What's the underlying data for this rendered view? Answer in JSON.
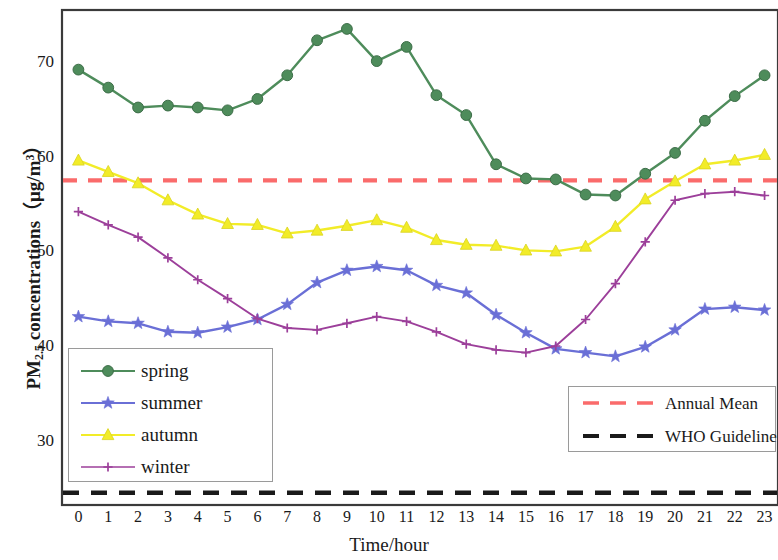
{
  "chart_data": {
    "type": "line",
    "title": "",
    "xlabel": "Time/hour",
    "ylabel": "PM2.5 concentrations （μg/m³）",
    "ylabel_parts": {
      "main": "PM",
      "subscript": "2.5",
      "rest": " concentrations",
      "unit_open": "（",
      "unit": "μg/m",
      "unit_sup": "3",
      "unit_close": "）"
    },
    "x": [
      0,
      1,
      2,
      3,
      4,
      5,
      6,
      7,
      8,
      9,
      10,
      11,
      12,
      13,
      14,
      15,
      16,
      17,
      18,
      19,
      20,
      21,
      22,
      23
    ],
    "xtick_labels": [
      "0",
      "1",
      "2",
      "3",
      "4",
      "5",
      "6",
      "7",
      "8",
      "9",
      "10",
      "11",
      "12",
      "13",
      "14",
      "15",
      "16",
      "17",
      "18",
      "19",
      "20",
      "21",
      "22",
      "23"
    ],
    "ytick_labels": [
      "70",
      "60",
      "50",
      "40",
      "30"
    ],
    "ytick_values": [
      70,
      60,
      50,
      40,
      30
    ],
    "xlim": [
      -0.55,
      23.45
    ],
    "ylim": [
      23.2,
      75.5
    ],
    "grid": false,
    "legend_position": "inside-lower-left and inside-lower-right",
    "series": [
      {
        "name": "spring",
        "color": "#4e8c5b",
        "marker": "circle",
        "values": [
          69.2,
          67.3,
          65.2,
          65.4,
          65.2,
          64.9,
          66.1,
          68.6,
          72.3,
          73.5,
          70.1,
          71.6,
          66.5,
          64.4,
          59.2,
          57.7,
          57.6,
          56.0,
          55.9,
          58.2,
          60.4,
          63.8,
          66.4,
          68.6
        ]
      },
      {
        "name": "summer",
        "color": "#6a6fd6",
        "marker": "star",
        "values": [
          43.1,
          42.6,
          42.4,
          41.5,
          41.4,
          42.0,
          42.8,
          44.4,
          46.7,
          48.0,
          48.4,
          48.0,
          46.4,
          45.6,
          43.3,
          41.4,
          39.7,
          39.3,
          38.9,
          39.9,
          41.7,
          43.9,
          44.1,
          43.8
        ]
      },
      {
        "name": "autumn",
        "color": "#f2ec28",
        "marker": "triangle",
        "values": [
          59.6,
          58.4,
          57.2,
          55.4,
          53.9,
          52.9,
          52.8,
          51.9,
          52.2,
          52.7,
          53.3,
          52.5,
          51.2,
          50.7,
          50.6,
          50.1,
          50.0,
          50.5,
          52.6,
          55.5,
          57.4,
          59.2,
          59.6,
          60.2
        ]
      },
      {
        "name": "winter",
        "color": "#9c3f9a",
        "marker": "plus",
        "values": [
          54.2,
          52.8,
          51.5,
          49.3,
          47.0,
          45.0,
          42.9,
          41.9,
          41.7,
          42.4,
          43.1,
          42.6,
          41.5,
          40.2,
          39.6,
          39.3,
          40.0,
          42.8,
          46.6,
          51.0,
          55.4,
          56.1,
          56.3,
          55.9
        ]
      }
    ],
    "reference_lines": [
      {
        "name": "Annual Mean",
        "value": 57.5,
        "color": "#fa6b6b",
        "style": "dashed"
      },
      {
        "name": "WHO Guideline",
        "value": 24.5,
        "color": "#1a1a1a",
        "style": "dashed"
      }
    ]
  },
  "legend_series": {
    "items": [
      {
        "label": "spring"
      },
      {
        "label": "summer"
      },
      {
        "label": "autumn"
      },
      {
        "label": "winter"
      }
    ]
  },
  "legend_reference": {
    "items": [
      {
        "label": "Annual Mean"
      },
      {
        "label": "WHO Guideline"
      }
    ]
  }
}
